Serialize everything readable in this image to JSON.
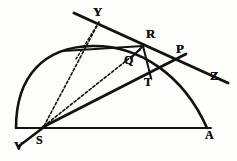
{
  "figure": {
    "background_color": "#fdfdfb",
    "ink_color": "#141210",
    "width": 237,
    "height": 161
  },
  "labels": [
    {
      "name": "point-label-y",
      "text": "Y",
      "x": 93,
      "y": 5,
      "size": 13
    },
    {
      "name": "point-label-r",
      "text": "R",
      "x": 146,
      "y": 27,
      "size": 13
    },
    {
      "name": "point-label-p",
      "text": "P",
      "x": 176,
      "y": 42,
      "size": 13
    },
    {
      "name": "point-label-z",
      "text": "Z",
      "x": 210,
      "y": 69,
      "size": 13
    },
    {
      "name": "point-label-q",
      "text": "Q",
      "x": 124,
      "y": 54,
      "size": 12
    },
    {
      "name": "point-label-t",
      "text": "T",
      "x": 144,
      "y": 76,
      "size": 12
    },
    {
      "name": "point-label-a",
      "text": "A",
      "x": 205,
      "y": 129,
      "size": 12
    },
    {
      "name": "point-label-s",
      "text": "S",
      "x": 36,
      "y": 134,
      "size": 12
    },
    {
      "name": "point-label-v",
      "text": "V",
      "x": 14,
      "y": 139,
      "size": 13
    }
  ],
  "geometry": {
    "baseline": {
      "name": "baseline-va",
      "x1": 16,
      "y1": 128,
      "x2": 211,
      "y2": 128,
      "width": 1.9
    },
    "arc": {
      "name": "semicircle-arc",
      "path": "M 16 128 C 16 76 44 47 92 46 C 140 45 184 76 207 128",
      "width": 2.6
    },
    "tangent_line_yz": {
      "name": "tangent-line-yz",
      "x1": 74,
      "y1": 13,
      "x2": 228,
      "y2": 83,
      "width": 3.0
    },
    "line_sp": {
      "name": "line-s-to-p",
      "x1": 43,
      "y1": 127,
      "x2": 186,
      "y2": 54,
      "width": 2.8
    },
    "line_sv": {
      "name": "line-s-to-v",
      "x1": 48,
      "y1": 124,
      "x2": 19,
      "y2": 146,
      "width": 2.6
    },
    "line_yr_drop": {
      "name": "line-y-perpendicular-drop",
      "x1": 99,
      "y1": 22,
      "x2": 76,
      "y2": 59,
      "width": 1.4,
      "dash": "2.4 2.2"
    },
    "line_sq": {
      "name": "line-s-to-q-dotted",
      "x1": 44,
      "y1": 126,
      "x2": 141,
      "y2": 49,
      "width": 1.6,
      "dash": "2.6 2.2"
    },
    "line_sy": {
      "name": "line-s-to-y-dotted",
      "x1": 44,
      "y1": 126,
      "x2": 99,
      "y2": 22,
      "width": 1.6,
      "dash": "2.6 2.2"
    },
    "line_qr": {
      "name": "line-q-to-r",
      "x1": 131,
      "y1": 58,
      "x2": 143,
      "y2": 46,
      "width": 2.0
    },
    "line_rt": {
      "name": "line-r-to-t",
      "x1": 143,
      "y1": 46,
      "x2": 151,
      "y2": 78,
      "width": 2.0
    },
    "chord_upper": {
      "name": "chord-through-arc",
      "x1": 63,
      "y1": 51,
      "x2": 143,
      "y2": 46,
      "width": 1.8
    }
  }
}
